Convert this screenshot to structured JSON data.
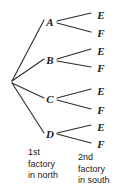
{
  "diagram": {
    "type": "probability-tree-diagram",
    "title": "",
    "background_color": "#ffffff",
    "line_color": "#2b2b2b",
    "text_color": "#1a1a1a",
    "root": {
      "label": "",
      "x": 11,
      "y": 82
    },
    "stage1": {
      "caption_lines": [
        "1st",
        "factory",
        "in north"
      ],
      "caption_text": "1st factory in north",
      "nodes": [
        {
          "label": "A",
          "x": 50,
          "y": 22
        },
        {
          "label": "B",
          "x": 50,
          "y": 60
        },
        {
          "label": "C",
          "x": 50,
          "y": 99
        },
        {
          "label": "D",
          "x": 50,
          "y": 134
        }
      ]
    },
    "stage2": {
      "caption_lines": [
        "2nd",
        "factory",
        "in south"
      ],
      "caption_text": "2nd factory in south",
      "nodes": [
        {
          "label": "E",
          "x": 101,
          "y": 15,
          "parent": "A"
        },
        {
          "label": "F",
          "x": 101,
          "y": 33,
          "parent": "A"
        },
        {
          "label": "E",
          "x": 101,
          "y": 51,
          "parent": "B"
        },
        {
          "label": "F",
          "x": 101,
          "y": 68,
          "parent": "B"
        },
        {
          "label": "E",
          "x": 101,
          "y": 91,
          "parent": "C"
        },
        {
          "label": "F",
          "x": 101,
          "y": 110,
          "parent": "C"
        },
        {
          "label": "E",
          "x": 101,
          "y": 127,
          "parent": "D"
        },
        {
          "label": "F",
          "x": 101,
          "y": 144,
          "parent": "D"
        }
      ]
    },
    "branches_stage1": [
      {
        "x1": 12,
        "y1": 81,
        "x2": 44,
        "y2": 20,
        "from": "root",
        "to": "A"
      },
      {
        "x1": 12,
        "y1": 81,
        "x2": 44,
        "y2": 59,
        "from": "root",
        "to": "B"
      },
      {
        "x1": 12,
        "y1": 83,
        "x2": 44,
        "y2": 98,
        "from": "root",
        "to": "C"
      },
      {
        "x1": 12,
        "y1": 83,
        "x2": 44,
        "y2": 133,
        "from": "root",
        "to": "D"
      }
    ],
    "branches_stage2": [
      {
        "x1": 57,
        "y1": 21,
        "x2": 91,
        "y2": 13,
        "from": "A",
        "to": "E"
      },
      {
        "x1": 57,
        "y1": 23,
        "x2": 91,
        "y2": 32,
        "from": "A",
        "to": "F"
      },
      {
        "x1": 57,
        "y1": 59,
        "x2": 91,
        "y2": 49,
        "from": "B",
        "to": "E"
      },
      {
        "x1": 57,
        "y1": 61,
        "x2": 91,
        "y2": 67,
        "from": "B",
        "to": "F"
      },
      {
        "x1": 57,
        "y1": 98,
        "x2": 91,
        "y2": 89,
        "from": "C",
        "to": "E"
      },
      {
        "x1": 57,
        "y1": 100,
        "x2": 91,
        "y2": 109,
        "from": "C",
        "to": "F"
      },
      {
        "x1": 57,
        "y1": 133,
        "x2": 91,
        "y2": 125,
        "from": "D",
        "to": "E"
      },
      {
        "x1": 57,
        "y1": 134,
        "x2": 91,
        "y2": 143,
        "from": "D",
        "to": "F"
      }
    ]
  }
}
